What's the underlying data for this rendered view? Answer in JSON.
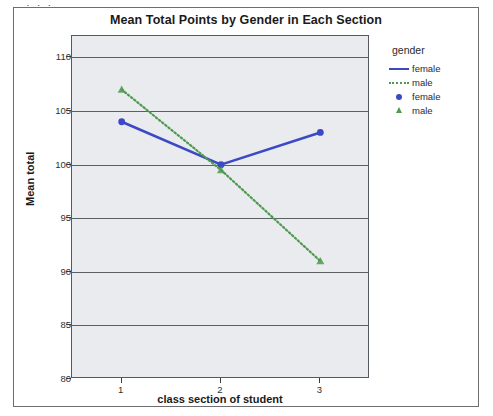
{
  "top_sliver_text": "· · ·",
  "chart": {
    "title": "Mean Total Points by Gender in Each Section",
    "x_axis_title": "class section of student",
    "y_axis_title": "Mean total"
  },
  "legend": {
    "title": "gender",
    "items": [
      {
        "label": "female",
        "key": "solid-line",
        "color": "#3b49c4"
      },
      {
        "label": "male",
        "key": "dotted-line",
        "color": "#4e9a4e"
      },
      {
        "label": "female",
        "key": "circle-marker",
        "color": "#3b49c4"
      },
      {
        "label": "male",
        "key": "triangle-marker",
        "color": "#4e9a4e"
      }
    ]
  },
  "colors": {
    "female": "#3b49c4",
    "male": "#4e9a4e",
    "plot_background": "#e9ebef",
    "gridline": "#5b5f66",
    "frame": "#6d6d72",
    "text": "#1a1a1a"
  },
  "chart_data": {
    "type": "line",
    "title": "Mean Total Points by Gender in Each Section",
    "xlabel": "class section of student",
    "ylabel": "Mean total",
    "categories": [
      "1",
      "2",
      "3"
    ],
    "x_tick_labels": [
      "1",
      "2",
      "3"
    ],
    "y_tick_labels": [
      "80",
      "85",
      "90",
      "95",
      "100",
      "105",
      "110"
    ],
    "y_ticks": [
      80,
      85,
      90,
      95,
      100,
      105,
      110
    ],
    "ylim": [
      80,
      112
    ],
    "grid": true,
    "legend_position": "right",
    "legend_title": "gender",
    "series": [
      {
        "name": "female",
        "values": [
          104,
          100,
          103
        ],
        "color": "#3b49c4",
        "line_style": "solid",
        "marker": "circle"
      },
      {
        "name": "male",
        "values": [
          107,
          99.5,
          91
        ],
        "color": "#4e9a4e",
        "line_style": "dotted",
        "marker": "triangle"
      }
    ]
  }
}
